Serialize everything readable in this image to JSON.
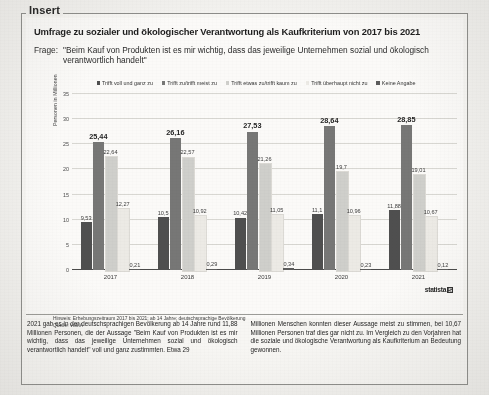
{
  "insert_label": "Insert",
  "chart": {
    "title": "Umfrage zu sozialer und ökologischer Verantwortung als Kaufkriterium von 2017 bis 2021",
    "question_label": "Frage:",
    "question_text": "\"Beim Kauf von Produkten ist es mir wichtig, dass das jeweilige Unternehmen sozial und ökologisch verantwortlich handelt\"",
    "ylabel": "Personen in Millionen",
    "note": "Hinweis: Erhebungszeitraum 2017 bis 2021; ab 14 Jahre; deutschsprachige Bevölkerung",
    "note_prefix": "Hinweis:",
    "source": "Quelle: VuMA",
    "source_prefix": "Quelle:",
    "source_value": "VuMA",
    "brand": "statista",
    "brand_mark": "S"
  },
  "chart_data": {
    "type": "bar",
    "title": "Umfrage zu sozialer und ökologischer Verantwortung als Kaufkriterium von 2017 bis 2021",
    "xlabel": "",
    "ylabel": "Personen in Millionen",
    "ylim": [
      0,
      35
    ],
    "yticks": [
      "0",
      "5",
      "10",
      "15",
      "20",
      "25",
      "30",
      "35"
    ],
    "grid": true,
    "legend_position": "top",
    "categories": [
      "2017",
      "2018",
      "2019",
      "2020",
      "2021"
    ],
    "series": [
      {
        "name": "Trifft voll und ganz zu",
        "color": "#4f4f4f",
        "values": [
          9.53,
          10.5,
          10.42,
          11.1,
          11.88
        ],
        "labels": [
          "9,53",
          "10,5",
          "10,42",
          "11,1",
          "11,88"
        ]
      },
      {
        "name": "Trifft zu/trifft meist zu",
        "color": "#777776",
        "values": [
          25.44,
          26.16,
          27.53,
          28.64,
          28.85
        ],
        "labels": [
          "25,44",
          "26,16",
          "27,53",
          "28,64",
          "28,85"
        ]
      },
      {
        "name": "Trifft etwas zu/trifft kaum zu",
        "color": "#cfcfcb",
        "values": [
          22.64,
          22.57,
          21.26,
          19.7,
          19.01
        ],
        "labels": [
          "22,64",
          "22,57",
          "21,26",
          "19,7",
          "19,01"
        ]
      },
      {
        "name": "Trifft überhaupt nicht zu",
        "color": "#eceae5",
        "values": [
          12.27,
          10.92,
          11.05,
          10.96,
          10.67
        ],
        "labels": [
          "12,27",
          "10,92",
          "11,05",
          "10,96",
          "10,67"
        ]
      },
      {
        "name": "Keine Angabe",
        "color": "#5c5c5c",
        "values": [
          0.21,
          0.29,
          0.34,
          0.23,
          0.12
        ],
        "labels": [
          "0,21",
          "0,29",
          "0,34",
          "0,23",
          "0,12"
        ]
      }
    ],
    "highlight_series_index": 1
  },
  "article": {
    "col_left": "2021 gab es in der deutschsprachigen Bevölkerung ab 14 Jahre rund 11,88 Millionen Personen, die der Aussage \"Beim Kauf von Produkten ist es mir wichtig, dass das jeweilige Unternehmen sozial und ökologisch verantwortlich handelt\" voll und ganz zustimmten. Etwa 29",
    "col_right": "Millionen Menschen konnten dieser Aussage meist zu stimmen, bei 10,67 Millionen Personen traf dies gar nicht zu. Im Vergleich zu den Vorjahren hat die soziale und ökologische Verantwortung als Kaufkriterium an Bedeutung gewonnen."
  }
}
